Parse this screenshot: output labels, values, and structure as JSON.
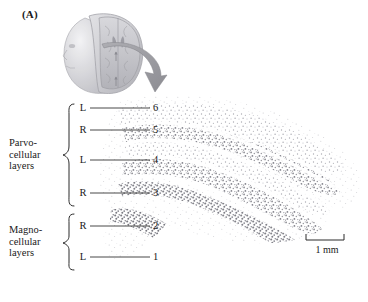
{
  "figure": {
    "panel_label": "(A)"
  },
  "inset": {
    "name": "head-with-coronal-brain-section",
    "arrow_name": "curved-arrow-pointing-to-micrograph"
  },
  "micrograph": {
    "name": "lgn-nissl-stained-section",
    "stipple_color": "#8b8b93",
    "background_color": "#ffffff"
  },
  "layers": [
    {
      "number": "6",
      "eye": "L",
      "line_y": 108,
      "division": "parvocellular"
    },
    {
      "number": "5",
      "eye": "R",
      "line_y": 130,
      "division": "parvocellular"
    },
    {
      "number": "4",
      "eye": "L",
      "line_y": 160,
      "division": "parvocellular"
    },
    {
      "number": "3",
      "eye": "R",
      "line_y": 193,
      "division": "parvocellular"
    },
    {
      "number": "2",
      "eye": "R",
      "line_y": 226,
      "division": "magnocellular"
    },
    {
      "number": "1",
      "eye": "L",
      "line_y": 257,
      "division": "magnocellular"
    }
  ],
  "groups": {
    "parvocellular": {
      "line1": "Parvo-",
      "line2": "cellular",
      "line3": "layers"
    },
    "magnocellular": {
      "line1": "Magno-",
      "line2": "cellular",
      "line3": "layers"
    }
  },
  "scalebar": {
    "caption": "1 mm",
    "length_px": 38
  },
  "colors": {
    "ink": "#1a1a1a",
    "leader_line": "#3a3a3a",
    "tissue": "#8b8b93",
    "inset_gray": "#b9b9bd",
    "arrow_gray": "#9a9a9e"
  }
}
